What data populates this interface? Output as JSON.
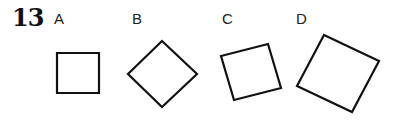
{
  "question": {
    "number": "13"
  },
  "options": [
    {
      "label": "A",
      "shape": "square",
      "rotation_deg": 0
    },
    {
      "label": "B",
      "shape": "square",
      "rotation_deg": 45
    },
    {
      "label": "C",
      "shape": "square",
      "rotation_deg": -15
    },
    {
      "label": "D",
      "shape": "square",
      "rotation_deg": 25
    }
  ],
  "colors": {
    "stroke": "#111111",
    "background": "#ffffff"
  }
}
